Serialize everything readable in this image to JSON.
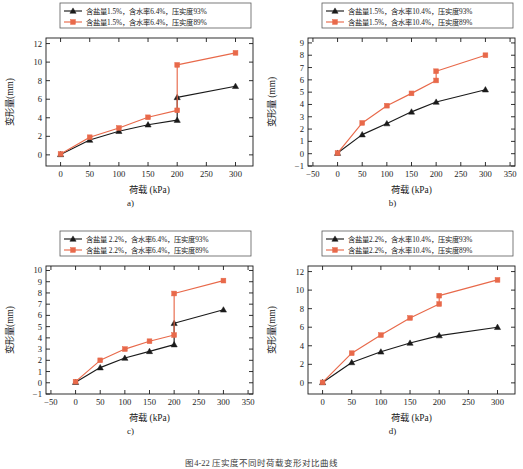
{
  "figure": {
    "caption": "图4-22  压实度不同时荷载变形对比曲线",
    "panel_labels": [
      "a)",
      "b)",
      "c)",
      "d)"
    ],
    "colors": {
      "series1": "#1a1a1a",
      "series2": "#e8694a",
      "axis": "#1a1a1a",
      "background": "#ffffff"
    }
  },
  "chart_data": [
    {
      "id": "a",
      "type": "line",
      "title": "",
      "xlabel": "荷载 (kPa)",
      "ylabel": "变形量(mm)",
      "xlim": [
        -25,
        330
      ],
      "ylim": [
        -1.2,
        12.6
      ],
      "xticks": [
        0,
        50,
        100,
        150,
        200,
        250,
        300
      ],
      "yticks": [
        0,
        2,
        4,
        6,
        8,
        10,
        12
      ],
      "grid": false,
      "legend_position": "top-center",
      "series": [
        {
          "name": "含盐量1.5%，含水率6.4%，压实度93%",
          "color": "#1a1a1a",
          "marker": "triangle",
          "x": [
            0,
            50,
            100,
            150,
            200,
            200,
            300
          ],
          "values": [
            0.05,
            1.6,
            2.55,
            3.25,
            3.75,
            6.2,
            7.4
          ]
        },
        {
          "name": "含盐量1.5%，含水率6.4%，压实度89%",
          "color": "#e8694a",
          "marker": "square",
          "x": [
            0,
            50,
            100,
            150,
            200,
            200,
            300
          ],
          "values": [
            0.1,
            1.9,
            2.9,
            4.05,
            4.8,
            9.7,
            11.0
          ]
        }
      ]
    },
    {
      "id": "b",
      "type": "line",
      "title": "",
      "xlabel": "荷载 (kPa)",
      "ylabel": "变形量 (mm)",
      "xlim": [
        -60,
        360
      ],
      "ylim": [
        -1,
        9.4
      ],
      "xticks": [
        -50,
        0,
        50,
        100,
        150,
        200,
        250,
        300,
        350
      ],
      "yticks": [
        -1,
        0,
        1,
        2,
        3,
        4,
        5,
        6,
        7,
        8,
        9
      ],
      "grid": false,
      "legend_position": "top-center",
      "series": [
        {
          "name": "含盐量1.5%，含水率10.4%，压实度93%",
          "color": "#1a1a1a",
          "marker": "triangle",
          "x": [
            0,
            50,
            100,
            150,
            200,
            300
          ],
          "values": [
            0.05,
            1.55,
            2.45,
            3.4,
            4.2,
            5.2
          ]
        },
        {
          "name": "含盐量1.5%，含水率10.4%，压实度89%",
          "color": "#e8694a",
          "marker": "square",
          "x": [
            0,
            50,
            100,
            150,
            200,
            200,
            300
          ],
          "values": [
            0.05,
            2.5,
            3.9,
            4.9,
            5.95,
            6.7,
            8.0
          ]
        }
      ]
    },
    {
      "id": "c",
      "type": "line",
      "title": "",
      "xlabel": "荷载 (kPa)",
      "ylabel": "变形量(mm)",
      "xlim": [
        -60,
        360
      ],
      "ylim": [
        -1,
        10.4
      ],
      "xticks": [
        -50,
        0,
        50,
        100,
        150,
        200,
        250,
        300,
        350
      ],
      "yticks": [
        -1,
        0,
        1,
        2,
        3,
        4,
        5,
        6,
        7,
        8,
        9,
        10
      ],
      "grid": false,
      "legend_position": "top-center",
      "series": [
        {
          "name": "含盐量 2.2%，含水率6.4%，压实度93%",
          "color": "#1a1a1a",
          "marker": "triangle",
          "x": [
            0,
            50,
            100,
            150,
            200,
            200,
            300
          ],
          "values": [
            0.05,
            1.35,
            2.2,
            2.8,
            3.4,
            5.3,
            6.5
          ]
        },
        {
          "name": "含盐量 2.2%，含水率6.4%，压实度89%",
          "color": "#e8694a",
          "marker": "square",
          "x": [
            0,
            50,
            100,
            150,
            200,
            200,
            300
          ],
          "values": [
            0.1,
            2.0,
            3.0,
            3.7,
            4.25,
            7.95,
            9.1
          ]
        }
      ]
    },
    {
      "id": "d",
      "type": "line",
      "title": "",
      "xlabel": "荷载 (kPa)",
      "ylabel": "变形量(mm)",
      "xlim": [
        -25,
        330
      ],
      "ylim": [
        -1.2,
        12.6
      ],
      "xticks": [
        0,
        50,
        100,
        150,
        200,
        250,
        300
      ],
      "yticks": [
        0,
        2,
        4,
        6,
        8,
        10,
        12
      ],
      "grid": false,
      "legend_position": "top-center",
      "series": [
        {
          "name": "含盐量2.2%，含水率10.4%，压实度93%",
          "color": "#1a1a1a",
          "marker": "triangle",
          "x": [
            0,
            50,
            100,
            150,
            200,
            300
          ],
          "values": [
            0.05,
            2.2,
            3.35,
            4.3,
            5.1,
            6.0
          ]
        },
        {
          "name": "含盐量2.2%，含水率10.4%，压实度89%",
          "color": "#e8694a",
          "marker": "square",
          "x": [
            0,
            50,
            100,
            150,
            200,
            200,
            300
          ],
          "values": [
            0.05,
            3.2,
            5.15,
            7.0,
            8.5,
            9.4,
            11.1
          ]
        }
      ]
    }
  ]
}
